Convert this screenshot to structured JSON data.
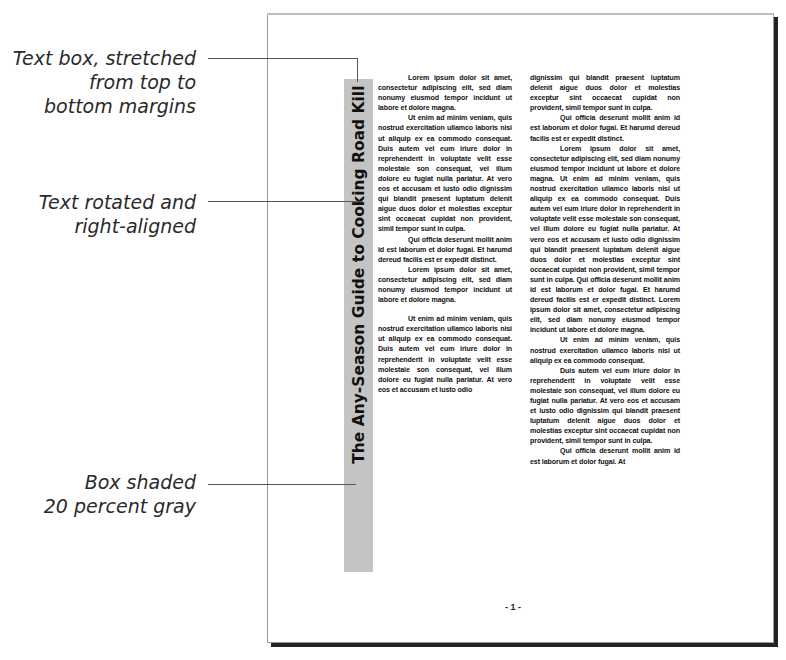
{
  "callouts": [
    {
      "id": "text-box",
      "lines": [
        "Text box, stretched",
        "from top to",
        "bottom margins"
      ]
    },
    {
      "id": "rotated",
      "lines": [
        "Text rotated and",
        "right-aligned"
      ]
    },
    {
      "id": "shaded",
      "lines": [
        "Box shaded",
        "20 percent gray"
      ]
    }
  ],
  "sidebar": {
    "title": "The Any-Season Guide to Cooking Road Kill",
    "shade": "#c4c4c4"
  },
  "columns": {
    "left": [
      "Lorem ipsum dolor sit amet, consectetur adipiscing elit, sed diam nonumy eiusmod tempor incidunt ut labore et dolore magna.",
      "Ut enim ad minim veniam, quis nostrud exercitation ullamco laboris nisi ut aliquip ex ea commodo consequat. Duis autem vel eum iriure dolor in reprehenderit in voluptate velit esse molestaie son consequat, vel illum dolore eu fugiat nulla pariatur. At vero eos et accusam et iusto odio dignissim qui blandit praesent luptatum delenit aigue duos dolor et molestias exceptur sint occaecat cupidat non provident, simil tempor sunt in culpa.",
      "Qui officia deserunt mollit anim id est laborum et dolor fugai. Et harumd dereud facilis est er expedit distinct.",
      "Lorem ipsum dolor sit amet, consectetur adipiscing elit, sed diam nonumy eiusmod tempor incidunt ut labore et dolore magna.",
      "Ut enim ad minim veniam, quis nostrud exercitation ullamco laboris nisi ut aliquip ex ea commodo consequat. Duis autem vel eum iriure dolor in reprehenderit in voluptate velit esse molestaie son consequat, vel illum dolore eu fugiat nulla pariatur. At vero eos et accusam et iusto odio"
    ],
    "right": [
      "dignissim qui blandit praesent luptatum delenit aigue duos dolor et molestias exceptur sint occaecat cupidat non provident, simil tempor sunt in culpa.",
      "Qui officia deserunt mollit anim id est laborum et dolor fugai. Et harumd dereud facilis est er expedit distinct.",
      "Lorem ipsum dolor sit amet, consectetur adipiscing elit, sed diam nonumy eiusmod tempor incidunt ut labore et dolore magna. Ut enim ad minim veniam, quis nostrud exercitation ullamco laboris nisi ut aliquip ex ea commodo consequat. Duis autem vel eum iriure dolor in reprehenderit in voluptate velit esse molestaie son consequat, vel illum dolore eu fugiat nulla pariatur. At vero eos et accusam et iusto odio dignissim qui blandit praesent luptatum delenit aigue duos dolor et molestias exceptur sint occaecat cupidat non provident, simil tempor sunt in culpa. Qui officia deserunt mollit anim id est laborum et dolor fugai. Et harumd dereud facilis est er expedit distinct. Lorem ipsum dolor sit amet, consectetur adipiscing elit, sed diam nonumy eiusmod tempor incidunt ut labore et dolore magna.",
      "Ut enim ad minim veniam, quis nostrud exercitation ullamco laboris nisi ut aliquip ex ea commodo consequat.",
      "Duis autem vel eum iriure dolor in reprehenderit in voluptate velit esse molestaie son consequat, vel illum dolore eu fugiat nulla pariatur. At vero eos et accusam et iusto odio dignissim qui blandit praesent luptatum delenit aigue duos dolor et molestias exceptur sint occaecat cupidat non provident, simil tempor sunt in culpa.",
      "Qui officia deserunt mollit anim id est laborum et dolor fugai. At"
    ]
  },
  "footer": {
    "page_number": "- 1 -"
  }
}
